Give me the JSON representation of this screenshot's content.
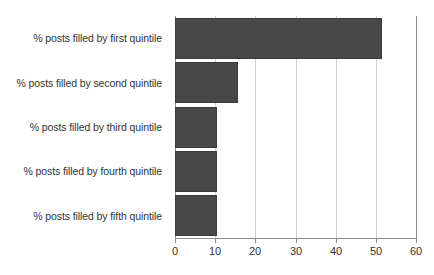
{
  "chart_data": {
    "type": "bar",
    "orientation": "horizontal",
    "title": "",
    "subtitle": "",
    "xlabel": "",
    "ylabel": "",
    "categories": [
      "% posts filled by first quintile",
      "% posts filled by second quintile",
      "% posts filled by third quintile",
      "% posts filled by fourth quintile",
      "% posts filled by fifth quintile"
    ],
    "values": [
      51.5,
      15.7,
      10.4,
      10.4,
      10.4
    ],
    "xlim": [
      0,
      60
    ],
    "xticks": [
      0,
      10,
      20,
      30,
      40,
      50,
      60
    ],
    "xtick_labels": [
      "0",
      "10",
      "20",
      "30",
      "40",
      "50",
      "60"
    ],
    "grid": "vertical",
    "legend": "none",
    "bar_color": "#474747",
    "gridline_color": "#d0d0d0",
    "axis_color": "#8c8c8c",
    "text_color": "#333333",
    "background": "#ffffff"
  }
}
